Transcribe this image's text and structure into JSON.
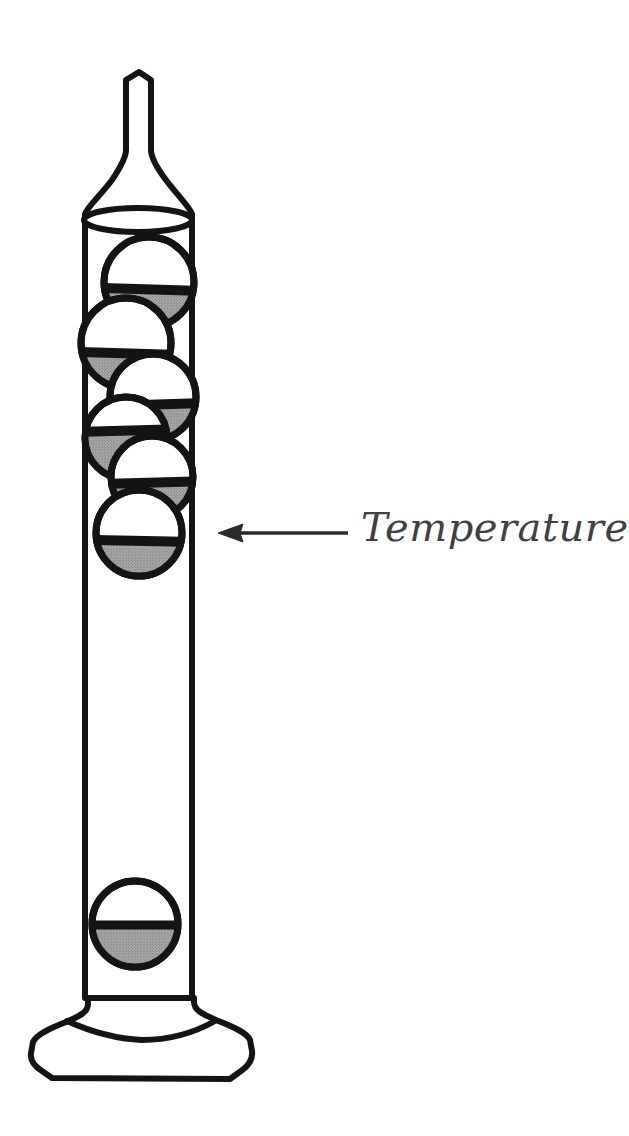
{
  "figure": {
    "background_color": "#ffffff",
    "ink_color": "#141414",
    "liquid_fill_color": "#9a9a9a",
    "glass_fill_color": "#ffffff"
  },
  "annotation": {
    "label": "Temperature",
    "label_color": "#3f3f46",
    "arrow": {
      "name": "leftward-arrow",
      "tip_x": 218,
      "tip_y": 533,
      "tail_x": 348,
      "tail_y": 533,
      "color": "#2b2b2b"
    }
  },
  "thermometer": {
    "name": "galileo-thermometer",
    "tip": {
      "x": 133,
      "y": 72,
      "neck_width": 17
    },
    "tube": {
      "left": 84,
      "right": 192,
      "top": 212,
      "bottom": 998
    },
    "liquid_surface_ellipse": {
      "cx": 138,
      "cy": 219,
      "rx": 54,
      "ry": 11
    },
    "base": {
      "left": 30,
      "right": 250,
      "top": 1000,
      "bottom": 1080
    },
    "float_count": 7,
    "floats": [
      {
        "index": 1,
        "cx": 149,
        "cy": 282,
        "r": 45,
        "fill_level": 0.4,
        "zone": "top-cluster"
      },
      {
        "index": 2,
        "cx": 126,
        "cy": 343,
        "r": 45,
        "fill_level": 0.47,
        "zone": "top-cluster"
      },
      {
        "index": 3,
        "cx": 153,
        "cy": 397,
        "r": 43,
        "fill_level": 0.55,
        "zone": "top-cluster"
      },
      {
        "index": 4,
        "cx": 126,
        "cy": 438,
        "r": 41,
        "fill_level": 0.38,
        "zone": "top-cluster"
      },
      {
        "index": 5,
        "cx": 152,
        "cy": 477,
        "r": 41,
        "fill_level": 0.52,
        "zone": "top-cluster"
      },
      {
        "index": 6,
        "cx": 139,
        "cy": 533,
        "r": 43,
        "fill_level": 0.5,
        "zone": "top-cluster"
      },
      {
        "index": 7,
        "cx": 135,
        "cy": 924,
        "r": 43,
        "fill_level": 0.52,
        "zone": "bottom"
      }
    ]
  }
}
